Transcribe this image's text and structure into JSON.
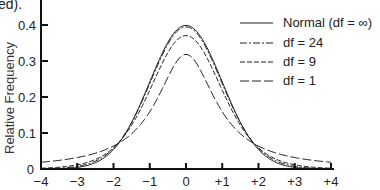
{
  "caption_fragment": "ed).",
  "chart_data": {
    "type": "line",
    "title": "",
    "xlabel": "",
    "ylabel": "Relative Frequency",
    "xlim": [
      -4,
      4
    ],
    "ylim": [
      0,
      0.4
    ],
    "grid": false,
    "legend_position": "upper right",
    "x_tick_labels": [
      "−4",
      "−3",
      "−2",
      "−1",
      "0",
      "+1",
      "+2",
      "+3",
      "+4"
    ],
    "x_ticks": [
      -4,
      -3,
      -2,
      -1,
      0,
      1,
      2,
      3,
      4
    ],
    "y_tick_labels": [
      "0",
      "0.1",
      "0.2",
      "0.3",
      "0.4"
    ],
    "y_ticks": [
      0,
      0.1,
      0.2,
      0.3,
      0.4
    ],
    "x": [
      -4,
      -3.5,
      -3,
      -2.5,
      -2,
      -1.5,
      -1,
      -0.5,
      0,
      0.5,
      1,
      1.5,
      2,
      2.5,
      3,
      3.5,
      4
    ],
    "series": [
      {
        "name": "Normal (df = ∞)",
        "style": "solid",
        "values": [
          0.0001,
          0.0009,
          0.0044,
          0.0175,
          0.054,
          0.1295,
          0.242,
          0.3521,
          0.3989,
          0.3521,
          0.242,
          0.1295,
          0.054,
          0.0175,
          0.0044,
          0.0009,
          0.0001
        ]
      },
      {
        "name": "df = 24",
        "style": "dash-dot",
        "values": [
          0.0006,
          0.0021,
          0.0068,
          0.0214,
          0.0574,
          0.1291,
          0.2366,
          0.3455,
          0.394,
          0.3455,
          0.2366,
          0.1291,
          0.0574,
          0.0214,
          0.0068,
          0.0021,
          0.0006
        ]
      },
      {
        "name": "df = 9",
        "style": "dashed",
        "values": [
          0.0031,
          0.0067,
          0.0132,
          0.0284,
          0.0621,
          0.1272,
          0.2304,
          0.3305,
          0.37,
          0.3305,
          0.2304,
          0.1272,
          0.0621,
          0.0284,
          0.0132,
          0.0067,
          0.0031
        ]
      },
      {
        "name": "df = 1",
        "style": "long-dash",
        "values": [
          0.0187,
          0.0241,
          0.0318,
          0.0439,
          0.0637,
          0.0979,
          0.1592,
          0.2546,
          0.3183,
          0.2546,
          0.1592,
          0.0979,
          0.0637,
          0.0439,
          0.0318,
          0.0241,
          0.0187
        ]
      }
    ]
  },
  "legend": {
    "items": [
      {
        "label": "Normal (df = ∞)",
        "dash": ""
      },
      {
        "label": "df = 24",
        "dash": "7 2 2 2"
      },
      {
        "label": "df = 9",
        "dash": "5 2"
      },
      {
        "label": "df = 1",
        "dash": "9 3"
      }
    ]
  },
  "colors": {
    "axis": "#111111",
    "line": "#222222",
    "background": "#ffffff"
  }
}
